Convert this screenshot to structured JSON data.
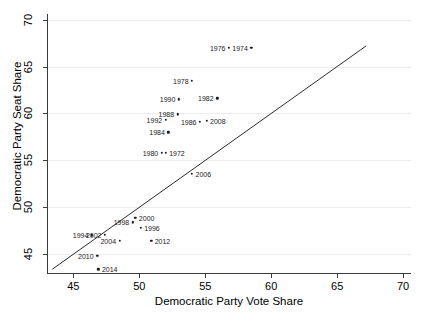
{
  "chart_data": {
    "type": "scatter",
    "title": "",
    "xlabel": "Democratic Party Vote Share",
    "ylabel": "Democratic Party Seat Share",
    "xlim": [
      43.0,
      70.6
    ],
    "ylim": [
      43.0,
      70.6
    ],
    "xticks": [
      "45",
      "50",
      "55",
      "60",
      "65",
      "70"
    ],
    "yticks": [
      "45",
      "50",
      "55",
      "60",
      "65",
      "70"
    ],
    "xtick_values": [
      45,
      50,
      55,
      60,
      65,
      70
    ],
    "ytick_values": [
      45,
      50,
      55,
      60,
      65,
      70
    ],
    "grid": "horizontal",
    "legend": "none",
    "reference_line": {
      "name": "45-degree line",
      "style": "solid",
      "from": [
        43.4,
        43.4
      ],
      "to": [
        67.2,
        67.2
      ]
    },
    "point_label_field": "year",
    "points": [
      {
        "year": "1972",
        "x": 52.0,
        "y": 55.8,
        "label_side": "right"
      },
      {
        "year": "1974",
        "x": 58.5,
        "y": 67.0,
        "label_side": "left"
      },
      {
        "year": "1976",
        "x": 56.8,
        "y": 67.0,
        "label_side": "left"
      },
      {
        "year": "1978",
        "x": 54.0,
        "y": 63.5,
        "label_side": "left"
      },
      {
        "year": "1980",
        "x": 51.7,
        "y": 55.8,
        "label_side": "left"
      },
      {
        "year": "1982",
        "x": 55.9,
        "y": 61.6,
        "label_side": "left"
      },
      {
        "year": "1984",
        "x": 52.2,
        "y": 58.0,
        "label_side": "left"
      },
      {
        "year": "1986",
        "x": 54.6,
        "y": 59.1,
        "label_side": "left"
      },
      {
        "year": "1988",
        "x": 52.9,
        "y": 59.9,
        "label_side": "left"
      },
      {
        "year": "1990",
        "x": 53.0,
        "y": 61.5,
        "label_side": "left"
      },
      {
        "year": "1992",
        "x": 52.0,
        "y": 59.3,
        "label_side": "left"
      },
      {
        "year": "1994",
        "x": 46.4,
        "y": 47.0,
        "label_side": "left"
      },
      {
        "year": "1996",
        "x": 50.1,
        "y": 47.8,
        "label_side": "right"
      },
      {
        "year": "1998",
        "x": 49.5,
        "y": 48.4,
        "label_side": "left"
      },
      {
        "year": "2000",
        "x": 49.7,
        "y": 48.9,
        "label_side": "right"
      },
      {
        "year": "2002",
        "x": 47.4,
        "y": 47.1,
        "label_side": "left"
      },
      {
        "year": "2004",
        "x": 48.5,
        "y": 46.4,
        "label_side": "left"
      },
      {
        "year": "2006",
        "x": 54.0,
        "y": 53.6,
        "label_side": "right"
      },
      {
        "year": "2008",
        "x": 55.1,
        "y": 59.2,
        "label_side": "right"
      },
      {
        "year": "2010",
        "x": 46.8,
        "y": 44.8,
        "label_side": "left"
      },
      {
        "year": "2012",
        "x": 50.9,
        "y": 46.4,
        "label_side": "right"
      },
      {
        "year": "2014",
        "x": 46.9,
        "y": 43.4,
        "label_side": "right"
      }
    ]
  },
  "colors": {
    "background": "#ffffff",
    "axis": "#3a3a3a",
    "grid": "#ececec",
    "marker": "#1a1a1a",
    "reference_line": "#2b2b2b",
    "text": "#000000"
  }
}
